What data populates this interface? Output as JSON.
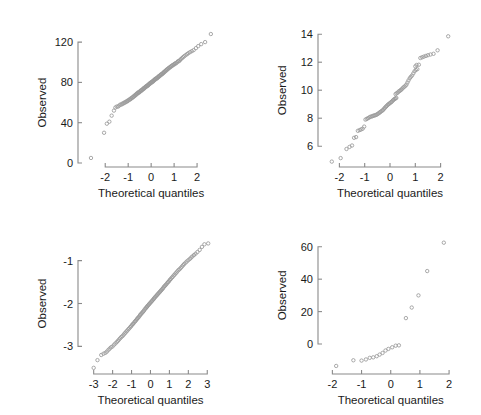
{
  "figure": {
    "background": "#ffffff",
    "marker_color": "#9a9a9a",
    "axis_color": "#8a8a8a",
    "text_color": "#1a1a1a",
    "panel_count": 4
  },
  "chart_data": [
    {
      "type": "scatter",
      "panel": "top-left",
      "title": "",
      "xlabel": "Theoretical quantiles",
      "ylabel": "Observed",
      "xlim": [
        -2.75,
        2.65
      ],
      "ylim": [
        0,
        132
      ],
      "xticks": [
        -2,
        -1,
        0,
        1,
        2
      ],
      "xticklabels": [
        "-2",
        "-1",
        "0",
        "1",
        "2"
      ],
      "yticks": [
        0,
        40,
        80,
        120
      ],
      "yticklabels": [
        "0",
        "40",
        "80",
        "120"
      ],
      "grid": false,
      "legend": "none",
      "points": [
        [
          -2.62,
          5
        ],
        [
          -2.05,
          30
        ],
        [
          -1.93,
          39
        ],
        [
          -1.82,
          41
        ],
        [
          -1.72,
          47
        ],
        [
          -1.62,
          52
        ],
        [
          -1.56,
          55
        ],
        [
          -1.5,
          56
        ],
        [
          -1.44,
          56
        ],
        [
          -1.39,
          57
        ],
        [
          -1.34,
          58
        ],
        [
          -1.29,
          58
        ],
        [
          -1.25,
          59
        ],
        [
          -1.21,
          59
        ],
        [
          -1.17,
          60
        ],
        [
          -1.13,
          60
        ],
        [
          -1.09,
          61
        ],
        [
          -1.05,
          61
        ],
        [
          -1.02,
          62
        ],
        [
          -0.99,
          62
        ],
        [
          -0.95,
          63
        ],
        [
          -0.92,
          63
        ],
        [
          -0.89,
          64
        ],
        [
          -0.86,
          64
        ],
        [
          -0.83,
          65
        ],
        [
          -0.8,
          65
        ],
        [
          -0.77,
          66
        ],
        [
          -0.75,
          66
        ],
        [
          -0.72,
          67
        ],
        [
          -0.69,
          67
        ],
        [
          -0.67,
          68
        ],
        [
          -0.64,
          68
        ],
        [
          -0.62,
          69
        ],
        [
          -0.59,
          69
        ],
        [
          -0.57,
          70
        ],
        [
          -0.54,
          70
        ],
        [
          -0.52,
          70
        ],
        [
          -0.5,
          71
        ],
        [
          -0.47,
          71
        ],
        [
          -0.45,
          72
        ],
        [
          -0.43,
          72
        ],
        [
          -0.41,
          72
        ],
        [
          -0.38,
          73
        ],
        [
          -0.36,
          73
        ],
        [
          -0.34,
          74
        ],
        [
          -0.32,
          74
        ],
        [
          -0.3,
          74
        ],
        [
          -0.28,
          75
        ],
        [
          -0.26,
          75
        ],
        [
          -0.23,
          76
        ],
        [
          -0.21,
          76
        ],
        [
          -0.19,
          76
        ],
        [
          -0.17,
          77
        ],
        [
          -0.15,
          77
        ],
        [
          -0.13,
          77
        ],
        [
          -0.11,
          78
        ],
        [
          -0.09,
          78
        ],
        [
          -0.07,
          79
        ],
        [
          -0.05,
          79
        ],
        [
          -0.03,
          79
        ],
        [
          -0.01,
          80
        ],
        [
          0.01,
          80
        ],
        [
          0.03,
          80
        ],
        [
          0.05,
          81
        ],
        [
          0.07,
          81
        ],
        [
          0.09,
          81
        ],
        [
          0.11,
          82
        ],
        [
          0.13,
          82
        ],
        [
          0.15,
          83
        ],
        [
          0.17,
          83
        ],
        [
          0.19,
          83
        ],
        [
          0.21,
          84
        ],
        [
          0.23,
          84
        ],
        [
          0.26,
          84
        ],
        [
          0.28,
          85
        ],
        [
          0.3,
          85
        ],
        [
          0.32,
          86
        ],
        [
          0.34,
          86
        ],
        [
          0.36,
          86
        ],
        [
          0.38,
          87
        ],
        [
          0.41,
          87
        ],
        [
          0.43,
          88
        ],
        [
          0.45,
          88
        ],
        [
          0.47,
          88
        ],
        [
          0.5,
          89
        ],
        [
          0.52,
          89
        ],
        [
          0.54,
          90
        ],
        [
          0.57,
          90
        ],
        [
          0.59,
          91
        ],
        [
          0.62,
          91
        ],
        [
          0.64,
          92
        ],
        [
          0.67,
          92
        ],
        [
          0.69,
          93
        ],
        [
          0.72,
          93
        ],
        [
          0.75,
          94
        ],
        [
          0.77,
          94
        ],
        [
          0.8,
          95
        ],
        [
          0.83,
          95
        ],
        [
          0.86,
          96
        ],
        [
          0.89,
          96
        ],
        [
          0.92,
          97
        ],
        [
          0.95,
          97
        ],
        [
          0.99,
          98
        ],
        [
          1.02,
          98
        ],
        [
          1.05,
          99
        ],
        [
          1.09,
          99
        ],
        [
          1.13,
          100
        ],
        [
          1.17,
          101
        ],
        [
          1.21,
          101
        ],
        [
          1.25,
          102
        ],
        [
          1.29,
          103
        ],
        [
          1.34,
          104
        ],
        [
          1.39,
          105
        ],
        [
          1.44,
          106
        ],
        [
          1.5,
          107
        ],
        [
          1.56,
          108
        ],
        [
          1.62,
          109
        ],
        [
          1.69,
          110
        ],
        [
          1.77,
          111
        ],
        [
          1.85,
          112
        ],
        [
          1.95,
          114
        ],
        [
          2.05,
          116
        ],
        [
          2.18,
          118
        ],
        [
          2.35,
          120
        ],
        [
          2.6,
          128
        ]
      ]
    },
    {
      "type": "scatter",
      "panel": "top-right",
      "title": "",
      "xlabel": "Theoretical quantiles",
      "ylabel": "Observed",
      "xlim": [
        -2.45,
        2.45
      ],
      "ylim": [
        4.8,
        14.3
      ],
      "xticks": [
        -2,
        -1,
        0,
        1,
        2
      ],
      "xticklabels": [
        "-2",
        "-1",
        "0",
        "1",
        "2"
      ],
      "yticks": [
        6,
        8,
        10,
        12,
        14
      ],
      "yticklabels": [
        "6",
        "8",
        "10",
        "12",
        "14"
      ],
      "grid": false,
      "legend": "none",
      "points": [
        [
          -2.3,
          4.9
        ],
        [
          -1.95,
          5.15
        ],
        [
          -1.72,
          5.8
        ],
        [
          -1.6,
          5.95
        ],
        [
          -1.5,
          6.05
        ],
        [
          -1.42,
          6.6
        ],
        [
          -1.34,
          6.65
        ],
        [
          -1.27,
          7.1
        ],
        [
          -1.2,
          7.15
        ],
        [
          -1.14,
          7.2
        ],
        [
          -1.08,
          7.25
        ],
        [
          -1.02,
          7.4
        ],
        [
          -0.97,
          7.9
        ],
        [
          -0.92,
          7.95
        ],
        [
          -0.87,
          8.0
        ],
        [
          -0.82,
          8.05
        ],
        [
          -0.78,
          8.1
        ],
        [
          -0.73,
          8.12
        ],
        [
          -0.69,
          8.15
        ],
        [
          -0.65,
          8.18
        ],
        [
          -0.61,
          8.2
        ],
        [
          -0.57,
          8.22
        ],
        [
          -0.53,
          8.25
        ],
        [
          -0.49,
          8.3
        ],
        [
          -0.45,
          8.35
        ],
        [
          -0.41,
          8.4
        ],
        [
          -0.38,
          8.45
        ],
        [
          -0.34,
          8.5
        ],
        [
          -0.3,
          8.55
        ],
        [
          -0.27,
          8.6
        ],
        [
          -0.23,
          8.68
        ],
        [
          -0.2,
          8.75
        ],
        [
          -0.16,
          8.82
        ],
        [
          -0.13,
          8.88
        ],
        [
          -0.09,
          8.95
        ],
        [
          -0.06,
          9.0
        ],
        [
          -0.02,
          9.05
        ],
        [
          0.01,
          9.1
        ],
        [
          0.05,
          9.15
        ],
        [
          0.08,
          9.2
        ],
        [
          0.12,
          9.28
        ],
        [
          0.15,
          9.33
        ],
        [
          0.19,
          9.38
        ],
        [
          0.22,
          9.42
        ],
        [
          0.25,
          9.45
        ],
        [
          0.22,
          9.72
        ],
        [
          0.26,
          9.78
        ],
        [
          0.3,
          9.82
        ],
        [
          0.34,
          9.9
        ],
        [
          0.38,
          9.95
        ],
        [
          0.42,
          10.0
        ],
        [
          0.45,
          10.05
        ],
        [
          0.49,
          10.12
        ],
        [
          0.53,
          10.2
        ],
        [
          0.57,
          10.25
        ],
        [
          0.61,
          10.32
        ],
        [
          0.65,
          10.4
        ],
        [
          0.69,
          10.55
        ],
        [
          0.73,
          10.7
        ],
        [
          0.78,
          10.85
        ],
        [
          0.82,
          10.95
        ],
        [
          0.87,
          11.05
        ],
        [
          0.92,
          11.2
        ],
        [
          0.97,
          11.35
        ],
        [
          1.02,
          11.45
        ],
        [
          1.08,
          11.5
        ],
        [
          1.0,
          11.7
        ],
        [
          1.05,
          11.8
        ],
        [
          1.14,
          11.82
        ],
        [
          1.2,
          12.3
        ],
        [
          1.27,
          12.35
        ],
        [
          1.34,
          12.4
        ],
        [
          1.42,
          12.45
        ],
        [
          1.5,
          12.5
        ],
        [
          1.6,
          12.55
        ],
        [
          1.72,
          12.6
        ],
        [
          1.88,
          12.85
        ],
        [
          2.3,
          13.85
        ]
      ]
    },
    {
      "type": "scatter",
      "panel": "bottom-left",
      "title": "",
      "xlabel": "Theoretical quantiles",
      "ylabel": "Observed",
      "xlim": [
        -3.3,
        3.25
      ],
      "ylim": [
        -3.55,
        -0.45
      ],
      "xticks": [
        -3,
        -2,
        -1,
        0,
        1,
        2,
        3
      ],
      "xticklabels": [
        "-3",
        "-2",
        "-1",
        "0",
        "1",
        "2",
        "3"
      ],
      "yticks": [
        -3,
        -2,
        -1
      ],
      "yticklabels": [
        "-3",
        "-2",
        "-1"
      ],
      "grid": false,
      "legend": "none",
      "points": [
        [
          -3.0,
          -3.5
        ],
        [
          -2.8,
          -3.32
        ],
        [
          -2.6,
          -3.2
        ],
        [
          -2.48,
          -3.17
        ],
        [
          -2.38,
          -3.15
        ],
        [
          -2.3,
          -3.12
        ],
        [
          -2.22,
          -3.08
        ],
        [
          -2.15,
          -3.05
        ],
        [
          -2.08,
          -3.02
        ],
        [
          -2.0,
          -3.0
        ],
        [
          -1.92,
          -2.96
        ],
        [
          -1.85,
          -2.93
        ],
        [
          -1.78,
          -2.9
        ],
        [
          -1.72,
          -2.87
        ],
        [
          -1.66,
          -2.84
        ],
        [
          -1.6,
          -2.81
        ],
        [
          -1.54,
          -2.78
        ],
        [
          -1.48,
          -2.76
        ],
        [
          -1.42,
          -2.73
        ],
        [
          -1.37,
          -2.7
        ],
        [
          -1.32,
          -2.68
        ],
        [
          -1.27,
          -2.65
        ],
        [
          -1.22,
          -2.63
        ],
        [
          -1.17,
          -2.6
        ],
        [
          -1.12,
          -2.58
        ],
        [
          -1.07,
          -2.55
        ],
        [
          -1.02,
          -2.53
        ],
        [
          -0.98,
          -2.5
        ],
        [
          -0.93,
          -2.48
        ],
        [
          -0.89,
          -2.46
        ],
        [
          -0.84,
          -2.43
        ],
        [
          -0.8,
          -2.41
        ],
        [
          -0.76,
          -2.39
        ],
        [
          -0.71,
          -2.36
        ],
        [
          -0.67,
          -2.34
        ],
        [
          -0.63,
          -2.32
        ],
        [
          -0.59,
          -2.3
        ],
        [
          -0.55,
          -2.27
        ],
        [
          -0.51,
          -2.25
        ],
        [
          -0.47,
          -2.23
        ],
        [
          -0.43,
          -2.21
        ],
        [
          -0.39,
          -2.19
        ],
        [
          -0.35,
          -2.17
        ],
        [
          -0.31,
          -2.14
        ],
        [
          -0.27,
          -2.12
        ],
        [
          -0.23,
          -2.1
        ],
        [
          -0.19,
          -2.08
        ],
        [
          -0.16,
          -2.06
        ],
        [
          -0.12,
          -2.04
        ],
        [
          -0.08,
          -2.02
        ],
        [
          -0.04,
          -2.0
        ],
        [
          0.0,
          -1.98
        ],
        [
          0.04,
          -1.96
        ],
        [
          0.08,
          -1.94
        ],
        [
          0.12,
          -1.92
        ],
        [
          0.16,
          -1.9
        ],
        [
          0.19,
          -1.88
        ],
        [
          0.23,
          -1.86
        ],
        [
          0.27,
          -1.84
        ],
        [
          0.31,
          -1.82
        ],
        [
          0.35,
          -1.8
        ],
        [
          0.39,
          -1.78
        ],
        [
          0.43,
          -1.76
        ],
        [
          0.47,
          -1.74
        ],
        [
          0.51,
          -1.72
        ],
        [
          0.55,
          -1.7
        ],
        [
          0.59,
          -1.68
        ],
        [
          0.63,
          -1.66
        ],
        [
          0.67,
          -1.64
        ],
        [
          0.71,
          -1.61
        ],
        [
          0.76,
          -1.59
        ],
        [
          0.8,
          -1.57
        ],
        [
          0.84,
          -1.55
        ],
        [
          0.89,
          -1.52
        ],
        [
          0.93,
          -1.5
        ],
        [
          0.98,
          -1.48
        ],
        [
          1.02,
          -1.45
        ],
        [
          1.07,
          -1.43
        ],
        [
          1.12,
          -1.4
        ],
        [
          1.17,
          -1.38
        ],
        [
          1.22,
          -1.35
        ],
        [
          1.27,
          -1.33
        ],
        [
          1.32,
          -1.3
        ],
        [
          1.37,
          -1.28
        ],
        [
          1.42,
          -1.25
        ],
        [
          1.48,
          -1.22
        ],
        [
          1.54,
          -1.2
        ],
        [
          1.6,
          -1.17
        ],
        [
          1.66,
          -1.14
        ],
        [
          1.72,
          -1.11
        ],
        [
          1.78,
          -1.08
        ],
        [
          1.85,
          -1.05
        ],
        [
          1.92,
          -1.02
        ],
        [
          2.0,
          -0.99
        ],
        [
          2.08,
          -0.96
        ],
        [
          2.15,
          -0.93
        ],
        [
          2.22,
          -0.9
        ],
        [
          2.3,
          -0.87
        ],
        [
          2.38,
          -0.84
        ],
        [
          2.48,
          -0.8
        ],
        [
          2.6,
          -0.75
        ],
        [
          2.72,
          -0.68
        ],
        [
          2.85,
          -0.62
        ],
        [
          3.05,
          -0.6
        ]
      ]
    },
    {
      "type": "scatter",
      "panel": "bottom-right",
      "title": "",
      "xlabel": "Theoretical quantiles",
      "ylabel": "Observed",
      "xlim": [
        -2.15,
        2.1
      ],
      "ylim": [
        -16,
        66
      ],
      "xticks": [
        -2,
        -1,
        0,
        1,
        2
      ],
      "xticklabels": [
        "-2",
        "-1",
        "0",
        "1",
        "2"
      ],
      "yticks": [
        0,
        20,
        40,
        60
      ],
      "yticklabels": [
        "0",
        "20",
        "40",
        "60"
      ],
      "grid": false,
      "legend": "none",
      "points": [
        [
          -1.87,
          -13.5
        ],
        [
          -1.28,
          -10.0
        ],
        [
          -1.0,
          -10.2
        ],
        [
          -0.85,
          -9.5
        ],
        [
          -0.72,
          -8.5
        ],
        [
          -0.6,
          -8.2
        ],
        [
          -0.48,
          -7.5
        ],
        [
          -0.38,
          -6.5
        ],
        [
          -0.28,
          -5.5
        ],
        [
          -0.18,
          -4.0
        ],
        [
          -0.08,
          -3.0
        ],
        [
          0.05,
          -2.0
        ],
        [
          0.17,
          -1.0
        ],
        [
          0.28,
          -0.8
        ],
        [
          0.52,
          16.0
        ],
        [
          0.72,
          22.5
        ],
        [
          0.95,
          30.0
        ],
        [
          1.25,
          45.0
        ],
        [
          1.82,
          62.5
        ]
      ]
    }
  ],
  "labels": {
    "observed": "Observed",
    "theoretical_quantiles": "Theoretical quantiles"
  }
}
